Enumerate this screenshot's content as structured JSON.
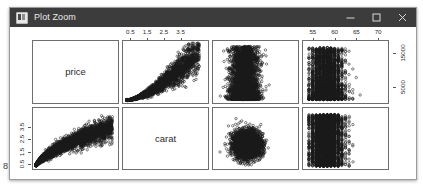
{
  "window": {
    "title": "Plot Zoom",
    "icon": "plot-window-icon",
    "titlebar_color": "#3c3c3c",
    "controls": [
      {
        "name": "minimize-button",
        "glyph": "─",
        "label": "Minimize"
      },
      {
        "name": "maximize-button",
        "glyph": "□",
        "label": "Maximize"
      },
      {
        "name": "close-button",
        "glyph": "×",
        "label": "Close"
      }
    ]
  },
  "stray_glyph": "8",
  "chart_data": {
    "type": "scatter",
    "title": "",
    "subtitle": "",
    "layout": "scatterplot-matrix",
    "rows": 2,
    "cols": 4,
    "grid": false,
    "legend": "none",
    "variables": [
      "price",
      "carat",
      "x3",
      "depth"
    ],
    "diagonal_labels": [
      "price",
      "carat"
    ],
    "axes": [
      {
        "name": "top-axis-carat",
        "position": "top",
        "column": 2,
        "variable": "carat",
        "ticks": [
          0.5,
          1.5,
          2.5,
          3.5
        ],
        "tick_labels": [
          "0.5",
          "1.5",
          "2.5",
          "3.5"
        ],
        "range": [
          0.0,
          5.2
        ]
      },
      {
        "name": "top-axis-depth",
        "position": "top",
        "column": 4,
        "variable": "depth",
        "ticks": [
          55,
          60,
          65,
          70
        ],
        "tick_labels": [
          "55",
          "60",
          "65",
          "70"
        ],
        "range": [
          52.5,
          72.5
        ]
      },
      {
        "name": "right-axis-price",
        "position": "right",
        "row": 1,
        "variable": "price",
        "ticks": [
          5000,
          15000
        ],
        "tick_labels": [
          "5000",
          "15000"
        ],
        "range": [
          0,
          19000
        ]
      },
      {
        "name": "left-axis-carat",
        "position": "left",
        "row": 2,
        "variable": "carat",
        "ticks": [
          0.5,
          1.5,
          2.5,
          3.5
        ],
        "tick_labels": [
          "0.5",
          "1.5",
          "2.5",
          "3.5"
        ],
        "range": [
          0.0,
          5.2
        ]
      }
    ],
    "panels": [
      {
        "name": "panel-price-diagonal",
        "row": 1,
        "col": 1,
        "kind": "diagonal",
        "label": "price",
        "xvar": "price",
        "yvar": "price"
      },
      {
        "name": "panel-price-vs-carat",
        "row": 1,
        "col": 2,
        "kind": "scatter",
        "xvar": "carat",
        "yvar": "price",
        "shape": "fan-exponential"
      },
      {
        "name": "panel-price-vs-x3",
        "row": 1,
        "col": 3,
        "kind": "scatter",
        "xvar": "x3",
        "yvar": "price",
        "shape": "dense-vertical-cloud"
      },
      {
        "name": "panel-price-vs-depth",
        "row": 1,
        "col": 4,
        "kind": "scatter",
        "xvar": "depth",
        "yvar": "price",
        "shape": "discrete-columns"
      },
      {
        "name": "panel-carat-vs-price",
        "row": 2,
        "col": 1,
        "kind": "scatter",
        "xvar": "price",
        "yvar": "carat",
        "shape": "log-saturating"
      },
      {
        "name": "panel-carat-diagonal",
        "row": 2,
        "col": 2,
        "kind": "diagonal",
        "label": "carat",
        "xvar": "carat",
        "yvar": "carat"
      },
      {
        "name": "panel-carat-vs-x3",
        "row": 2,
        "col": 3,
        "kind": "scatter",
        "xvar": "x3",
        "yvar": "carat",
        "shape": "dense-blob"
      },
      {
        "name": "panel-carat-vs-depth",
        "row": 2,
        "col": 4,
        "kind": "scatter",
        "xvar": "depth",
        "yvar": "carat",
        "shape": "discrete-columns"
      }
    ],
    "point_style": {
      "marker": "open-circle",
      "color": "#1a1a1a",
      "size": 2
    }
  }
}
